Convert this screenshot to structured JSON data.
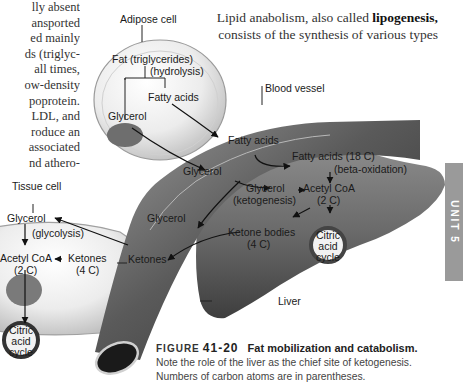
{
  "body_text_left": {
    "lines": [
      "lly absent",
      "ansported",
      "ed mainly",
      "ds (triglyc-",
      "all times,",
      "ow-density",
      "poprotein.",
      "LDL, and",
      "roduce an",
      "associated",
      "nd athero-"
    ]
  },
  "body_text_right": {
    "prefix": "Lipid anabolism, also called ",
    "term": "lipogenesis,",
    "line2": "consists of the synthesis of various types"
  },
  "unit_tab": {
    "label": "UNIT 5",
    "color": "#9a9a9a"
  },
  "diagram": {
    "adipose_cell": {
      "title": "Adipose cell",
      "fat": "Fat (triglycerides)",
      "hydrolysis": "(hydrolysis)",
      "fatty_acids": "Fatty acids",
      "glycerol": "Glycerol"
    },
    "blood_vessel": {
      "title": "Blood vessel",
      "fatty_acids": "Fatty acids",
      "glycerol_upper": "Glycerol",
      "glycerol_lower": "Glycerol",
      "ketones": "Ketones"
    },
    "liver": {
      "title": "Liver",
      "fatty_acids_18c": "Fatty acids (18 C)",
      "beta_oxidation": "(beta-oxidation)",
      "glycerol": "Glycerol",
      "ketogenesis": "(ketogenesis)",
      "acetyl_coa": "Acetyl CoA",
      "acetyl_coa_c": "(2 C)",
      "ketone_bodies": "Ketone bodies",
      "ketone_bodies_c": "(4 C)",
      "cycle": [
        "Citric",
        "acid",
        "cycle"
      ]
    },
    "tissue_cell": {
      "title": "Tissue cell",
      "glycerol": "Glycerol",
      "glycolysis": "(glycolysis)",
      "acetyl_coa": "Acetyl CoA",
      "acetyl_coa_c": "(2 C)",
      "ketones": "Ketones",
      "ketones_c": "(4 C)",
      "cycle": [
        "Citric",
        "acid",
        "cycle"
      ]
    }
  },
  "caption": {
    "figure_word": "FIGURE",
    "figure_number": "41-20",
    "title": "Fat mobilization and catabolism.",
    "line1": "Note the role of the liver as the chief site of ketogenesis.",
    "line2": "Numbers of carbon atoms are in parentheses."
  }
}
